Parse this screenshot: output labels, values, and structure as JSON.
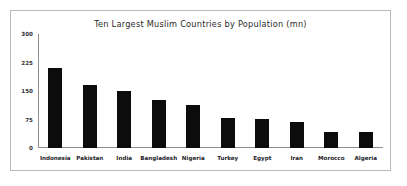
{
  "card": {
    "border_color": "#b9b9b9",
    "background": "#ffffff"
  },
  "chart_data": {
    "type": "bar",
    "title": "Ten Largest Muslim Countries by Population (mn)",
    "xlabel": "",
    "ylabel": "",
    "ylim": [
      0,
      300
    ],
    "yticks": [
      0,
      75,
      150,
      225,
      300
    ],
    "ytick_labels": [
      "0",
      "75",
      "150",
      "225",
      "300"
    ],
    "grid": false,
    "legend": false,
    "bar_color": "#0c0c0c",
    "axis_color": "#8e8e8e",
    "categories": [
      "Indonesia",
      "Pakistan",
      "India",
      "Bangladesh",
      "Nigeria",
      "Turkey",
      "Egypt",
      "Iran",
      "Morocco",
      "Algeria"
    ],
    "values": [
      210,
      165,
      149,
      127,
      114,
      80,
      77,
      69,
      43,
      43
    ],
    "series": [
      {
        "name": "Population (mn)",
        "values": [
          210,
          165,
          149,
          127,
          114,
          80,
          77,
          69,
          43,
          43
        ]
      }
    ]
  }
}
